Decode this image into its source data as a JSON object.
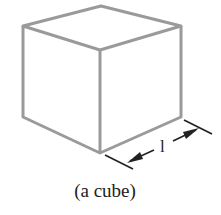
{
  "diagram": {
    "shape": "cube",
    "dimension_label": "l",
    "caption": "(a cube)",
    "colors": {
      "edge": "#9a9a9a",
      "dimension": "#222222"
    }
  }
}
